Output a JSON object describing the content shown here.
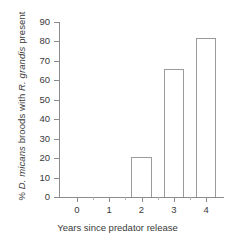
{
  "chart_data": {
    "type": "bar",
    "title": "",
    "subtitle": "",
    "xlabel": "Years since predator release",
    "ylabel_parts": [
      {
        "text": "% ",
        "italic": false
      },
      {
        "text": "D. micans",
        "italic": true
      },
      {
        "text": " broods with ",
        "italic": false
      },
      {
        "text": "R. grandis",
        "italic": true
      },
      {
        "text": " present",
        "italic": false
      }
    ],
    "ylabel": "% D. micans broods with R. grandis present",
    "categories": [
      "0",
      "1",
      "2",
      "3",
      "4"
    ],
    "values": [
      0,
      0,
      20.5,
      66,
      82
    ],
    "xlim": [
      -0.55,
      4.55
    ],
    "ylim": [
      0,
      90
    ],
    "yticks": [
      0,
      10,
      20,
      30,
      40,
      50,
      60,
      70,
      80,
      90
    ],
    "ytick_labels": [
      "0",
      "10",
      "20",
      "30",
      "40",
      "50",
      "60",
      "70",
      "80",
      "90"
    ],
    "xticks": [
      0,
      1,
      2,
      3,
      4
    ],
    "xtick_labels": [
      "0",
      "1",
      "2",
      "3",
      "4"
    ],
    "minor_xticks": [
      0.5,
      1.5,
      2.5,
      3.5
    ],
    "grid": false,
    "legend": null,
    "bar_width": 0.62,
    "bar_fill_color": "#ffffff",
    "bar_edge_color": "#9a9a9a",
    "axis_color": "#8c8c8c",
    "text_color": "#3a3a3a",
    "background_color": "#ffffff"
  }
}
